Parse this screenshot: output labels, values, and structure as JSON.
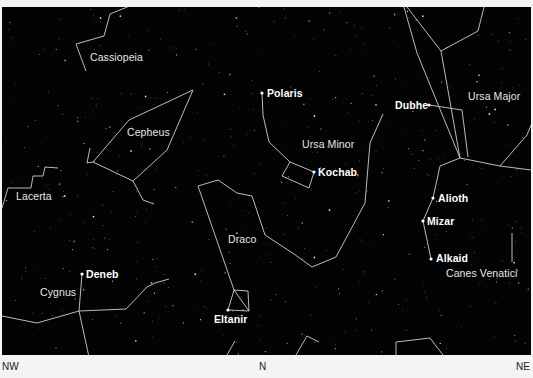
{
  "map": {
    "type": "star-chart",
    "background": "#030303",
    "line_color": "#cfcfcf",
    "constellations": [
      {
        "name": "Cassiopeia",
        "label_pos": [
          90,
          52
        ]
      },
      {
        "name": "Cepheus",
        "label_pos": [
          127,
          127
        ]
      },
      {
        "name": "Ursa Minor",
        "label_pos": [
          302,
          139
        ]
      },
      {
        "name": "Ursa Major",
        "label_pos": [
          468,
          90
        ]
      },
      {
        "name": "Lacerta",
        "label_pos": [
          16,
          191
        ]
      },
      {
        "name": "Draco",
        "label_pos": [
          228,
          234
        ]
      },
      {
        "name": "Cygnus",
        "label_pos": [
          40,
          286
        ]
      },
      {
        "name": "Canes Venatici",
        "label_pos": [
          446,
          267
        ]
      }
    ],
    "stars": [
      {
        "name": "Polaris",
        "pos": [
          262,
          93
        ],
        "label_pos": [
          267,
          87
        ]
      },
      {
        "name": "Kochab",
        "pos": [
          314,
          172
        ],
        "label_pos": [
          318,
          166
        ]
      },
      {
        "name": "Dubhe",
        "pos": [
          429,
          105
        ],
        "label_pos": [
          395,
          99
        ]
      },
      {
        "name": "Alioth",
        "pos": [
          433,
          198
        ],
        "label_pos": [
          438,
          192
        ]
      },
      {
        "name": "Mizar",
        "pos": [
          423,
          221
        ],
        "label_pos": [
          427,
          215
        ]
      },
      {
        "name": "Alkaid",
        "pos": [
          431,
          259
        ],
        "label_pos": [
          436,
          252
        ]
      },
      {
        "name": "Deneb",
        "pos": [
          82,
          274
        ],
        "label_pos": [
          86,
          268
        ]
      },
      {
        "name": "Eltanir",
        "pos": [
          228,
          310
        ],
        "label_pos": [
          214,
          313
        ]
      }
    ]
  },
  "labels": {
    "cassiopeia": "Cassiopeia",
    "cepheus": "Cepheus",
    "ursa_minor": "Ursa Minor",
    "ursa_major": "Ursa Major",
    "lacerta": "Lacerta",
    "draco": "Draco",
    "cygnus": "Cygnus",
    "canes_venatici": "Canes Venatici",
    "polaris": "Polaris",
    "kochab": "Kochab",
    "dubhe": "Dubhe",
    "alioth": "Alioth",
    "mizar": "Mizar",
    "alkaid": "Alkaid",
    "deneb": "Deneb",
    "eltanir": "Eltanir"
  },
  "directions": {
    "left": "NW",
    "center": "N",
    "right": "NE"
  }
}
